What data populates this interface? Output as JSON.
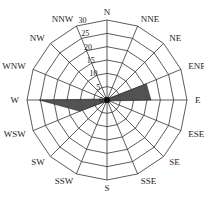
{
  "chart_data": {
    "type": "radar",
    "title": "",
    "categories": [
      "N",
      "NNE",
      "NE",
      "ENE",
      "E",
      "ESE",
      "SE",
      "SSE",
      "S",
      "SSW",
      "SW",
      "WSW",
      "W",
      "WNW",
      "NW",
      "NNW"
    ],
    "series": [
      {
        "name": "frequency",
        "values": [
          1,
          1,
          1,
          16,
          16.5,
          1,
          1,
          1,
          1,
          1,
          1,
          11,
          25.5,
          1,
          1,
          1
        ],
        "color": "#4a4a4a"
      }
    ],
    "rlim": [
      0,
      30
    ],
    "rticks": [
      0,
      5,
      10,
      15,
      20,
      25,
      30
    ],
    "grid": true,
    "grid_shape": "polygon"
  },
  "colors": {
    "grid": "#333333",
    "fill": "#4a4a4a",
    "text": "#222222"
  }
}
